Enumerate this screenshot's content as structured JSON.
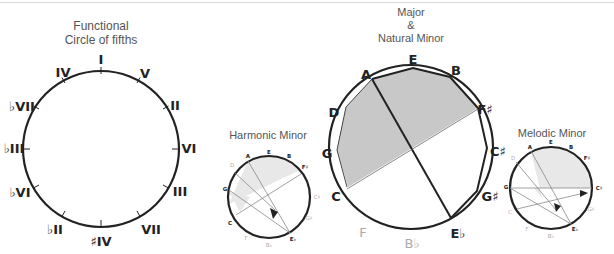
{
  "diagrams": {
    "functional": {
      "title_line1": "Functional",
      "title_line2": "Circle of fifths",
      "labels": [
        "I",
        "V",
        "II",
        "VI",
        "III",
        "VII",
        "♯IV",
        "♭II",
        "♭VI",
        "♭III",
        "♭VII",
        "IV"
      ]
    },
    "harmonic_minor": {
      "title": "Harmonic Minor",
      "labels": [
        "E",
        "B",
        "F♯",
        "C♯",
        "G♯",
        "E♭",
        "B♭",
        "F",
        "C",
        "G",
        "D",
        "A"
      ]
    },
    "major_natural_minor": {
      "title_line1": "Major",
      "title_line2": "&",
      "title_line3": "Natural Minor",
      "labels": [
        "E",
        "B",
        "F♯",
        "C♯",
        "G♯",
        "E♭",
        "B♭",
        "F",
        "C",
        "G",
        "D",
        "A"
      ]
    },
    "melodic_minor": {
      "title": "Melodic Minor",
      "labels": [
        "E",
        "B",
        "F♯",
        "C♯",
        "G♯",
        "E♭",
        "B♭",
        "F",
        "C",
        "G",
        "D",
        "A"
      ]
    }
  },
  "colors": {
    "stroke": "#222222",
    "shade": "#c8c8c8",
    "shade_light": "#e6e6e6",
    "faint_label": "#aaaaaa",
    "title": "#555555"
  }
}
